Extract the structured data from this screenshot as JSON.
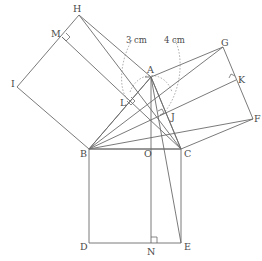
{
  "diagram": {
    "stroke_color": "#6b6b6b",
    "dashed_color": "#a8a8a8",
    "measurements": {
      "left_arc_label": "3 cm",
      "right_arc_label": "4 cm"
    },
    "points": {
      "A": "A",
      "B": "B",
      "C": "C",
      "D": "D",
      "E": "E",
      "F": "F",
      "G": "G",
      "H": "H",
      "I": "I",
      "J": "J",
      "K": "K",
      "L": "L",
      "M": "M",
      "N": "N",
      "O": "O"
    }
  }
}
